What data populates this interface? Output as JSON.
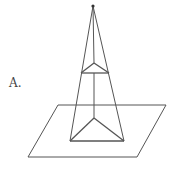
{
  "figure": {
    "label": "A.",
    "stroke_color": "#555555",
    "apex": [
      93,
      6
    ],
    "upper_section": {
      "left": [
        81,
        73
      ],
      "right": [
        109,
        73
      ],
      "back": [
        94,
        63
      ]
    },
    "base": {
      "left": [
        70,
        141
      ],
      "right": [
        124,
        141
      ],
      "back": [
        94,
        118
      ]
    },
    "plane": {
      "top_left": [
        58,
        105
      ],
      "top_right": [
        166,
        105
      ],
      "bottom_right": [
        137,
        157
      ],
      "bottom_left": [
        28,
        157
      ]
    }
  }
}
